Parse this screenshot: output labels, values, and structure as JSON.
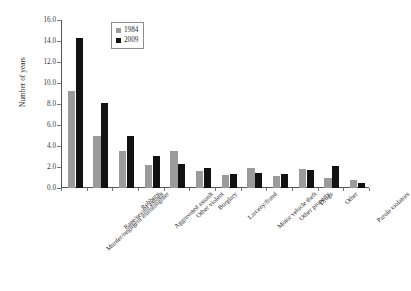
{
  "chart_data": {
    "type": "bar",
    "title": "",
    "xlabel": "",
    "ylabel": "Number of years",
    "ylim": [
      0,
      16
    ],
    "ytick_step": 2,
    "ytick_labels": [
      "0.0",
      "2.0",
      "4.0",
      "6.0",
      "8.0",
      "10.0",
      "12.0",
      "14.0",
      "16.0"
    ],
    "grid": false,
    "legend_position": "top-left-inside",
    "categories": [
      "Murder/negligent manslaughter",
      "Rape/sexual assault",
      "Robbery",
      "Aggravated assault",
      "Other violent",
      "Burglary",
      "Larceny/fraud",
      "Motor vehicle theft",
      "Other property",
      "Drugs",
      "Other",
      "Parole violators"
    ],
    "series": [
      {
        "name": "1984",
        "color": "#9b9b9b",
        "values": [
          9.2,
          5.0,
          3.5,
          2.15,
          3.5,
          1.6,
          1.25,
          1.9,
          1.1,
          1.85,
          1.0,
          0.75
        ]
      },
      {
        "name": "2009",
        "color": "#121212",
        "values": [
          14.3,
          8.05,
          5.0,
          3.05,
          2.25,
          1.9,
          1.3,
          1.45,
          1.35,
          1.75,
          2.05,
          0.45
        ]
      }
    ]
  }
}
